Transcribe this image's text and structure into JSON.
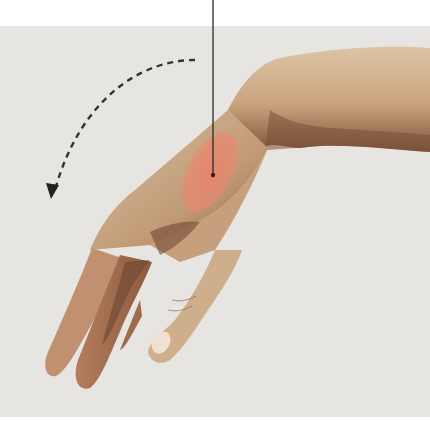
{
  "figure": {
    "background_color": "#e6e5e1",
    "page_color": "#ffffff",
    "skin_light": "#d9c0a2",
    "skin_mid": "#c4a07c",
    "skin_shadow": "#7a5038",
    "highlight_color": "#e8806a",
    "annotation_color": "#2a2a2a",
    "annotations": {
      "motion_arrow": "dashed curved arrow indicating downward flexion",
      "pointer_line": "vertical leader line pointing to highlighted area"
    }
  }
}
